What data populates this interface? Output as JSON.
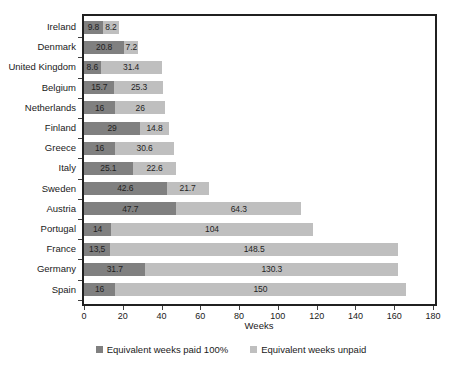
{
  "chart_data": {
    "type": "bar",
    "orientation": "horizontal",
    "stacked": true,
    "title": "",
    "xlabel": "Weeks",
    "ylabel": "",
    "xlim": [
      0,
      180
    ],
    "xticks": [
      0,
      20,
      40,
      60,
      80,
      100,
      120,
      140,
      160,
      180
    ],
    "grid": false,
    "legend_position": "bottom",
    "categories": [
      "Ireland",
      "Denmark",
      "United Kingdom",
      "Belgium",
      "Netherlands",
      "Finland",
      "Greece",
      "Italy",
      "Sweden",
      "Austria",
      "Portugal",
      "France",
      "Germany",
      "Spain"
    ],
    "series": [
      {
        "name": "Equivalent weeks paid 100%",
        "color": "#808080",
        "values": [
          9.8,
          20.8,
          8.6,
          15.7,
          16,
          29,
          16,
          25.1,
          42.6,
          47.7,
          14,
          13.5,
          31.7,
          16
        ]
      },
      {
        "name": "Equivalent weeks unpaid",
        "color": "#bfbfbf",
        "values": [
          8.2,
          7.2,
          31.4,
          25.3,
          26,
          14.8,
          30.6,
          22.6,
          21.7,
          64.3,
          104,
          148.5,
          130.3,
          150
        ]
      }
    ],
    "bar_labels": {
      "paid": [
        "9.8",
        "20.8",
        "8.6",
        "15.7",
        "16",
        "29",
        "16",
        "25.1",
        "42.6",
        "47.7",
        "14",
        "13,5",
        "31.7",
        "16"
      ],
      "unpaid": [
        "8.2",
        "7.2",
        "31.4",
        "25.3",
        "26",
        "14.8",
        "30.6",
        "22.6",
        "21.7",
        "64.3",
        "104",
        "148.5",
        "130.3",
        "150"
      ]
    }
  },
  "legend": {
    "items": [
      {
        "label": "Equivalent weeks paid 100%",
        "swatch": "paid"
      },
      {
        "label": "Equivalent weeks unpaid",
        "swatch": "unpaid"
      }
    ]
  },
  "axis": {
    "x_title": "Weeks"
  }
}
